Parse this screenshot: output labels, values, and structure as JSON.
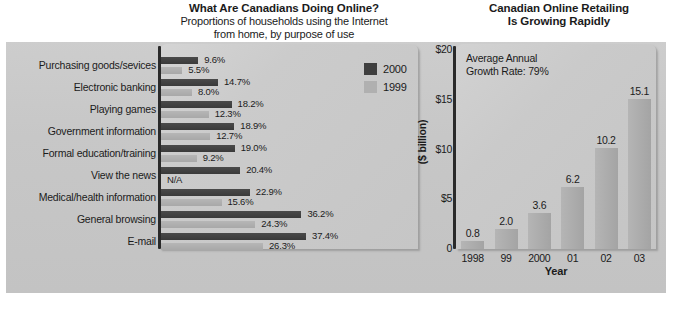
{
  "left": {
    "title_main": "What Are Canadians Doing Online?",
    "title_sub_line1": "Proportions of households using the Internet",
    "title_sub_line2": "from home, by purpose of use",
    "legend": [
      {
        "label": "2000",
        "color": "#3f3f3f"
      },
      {
        "label": "1999",
        "color": "#b0b0b0"
      }
    ]
  },
  "right": {
    "title_line1": "Canadian Online Retailing",
    "title_line2": "Is Growing Rapidly",
    "annotation_line1": "Average Annual",
    "annotation_line2": "Growth Rate: 79%",
    "ylabel": "($ billion)",
    "xlabel": "Year",
    "yticks": [
      "$20",
      "$15",
      "$10",
      "$5",
      "0"
    ]
  },
  "chart_data": [
    {
      "type": "bar",
      "orientation": "horizontal",
      "title": "What Are Canadians Doing Online?",
      "subtitle": "Proportions of households using the Internet from home, by purpose of use",
      "xlabel": "",
      "ylabel": "",
      "grid": false,
      "legend_position": "top-right",
      "categories": [
        "Purchasing goods/sevices",
        "Electronic banking",
        "Playing games",
        "Government information",
        "Formal education/training",
        "View the news",
        "Medical/health information",
        "General browsing",
        "E-mail"
      ],
      "series": [
        {
          "name": "2000",
          "color": "#3f3f3f",
          "values": [
            9.6,
            14.7,
            18.2,
            18.9,
            19.0,
            20.4,
            22.9,
            36.2,
            37.4
          ],
          "labels": [
            "9.6%",
            "14.7%",
            "18.2%",
            "18.9%",
            "19.0%",
            "20.4%",
            "22.9%",
            "36.2%",
            "37.4%"
          ]
        },
        {
          "name": "1999",
          "color": "#b0b0b0",
          "values": [
            5.5,
            8.0,
            12.3,
            12.7,
            9.2,
            null,
            15.6,
            24.3,
            26.3
          ],
          "labels": [
            "5.5%",
            "8.0%",
            "12.3%",
            "12.7%",
            "9.2%",
            "N/A",
            "15.6%",
            "24.3%",
            "26.3%"
          ]
        }
      ],
      "xlim": [
        0,
        40
      ],
      "units": "percent"
    },
    {
      "type": "bar",
      "orientation": "vertical",
      "title": "Canadian Online Retailing Is Growing Rapidly",
      "annotation": "Average Annual Growth Rate: 79%",
      "xlabel": "Year",
      "ylabel": "($ billion)",
      "grid": false,
      "categories": [
        "1998",
        "99",
        "2000",
        "01",
        "02",
        "03"
      ],
      "values": [
        0.8,
        2.0,
        3.6,
        6.2,
        10.2,
        15.1
      ],
      "labels": [
        "0.8",
        "2.0",
        "3.6",
        "6.2",
        "10.2",
        "15.1"
      ],
      "ylim": [
        0,
        20
      ],
      "ytick_values": [
        20,
        15,
        10,
        5,
        0
      ],
      "ytick_labels": [
        "$20",
        "$15",
        "$10",
        "$5",
        "0"
      ],
      "units": "billion dollars",
      "bar_color": "#ababab"
    }
  ]
}
